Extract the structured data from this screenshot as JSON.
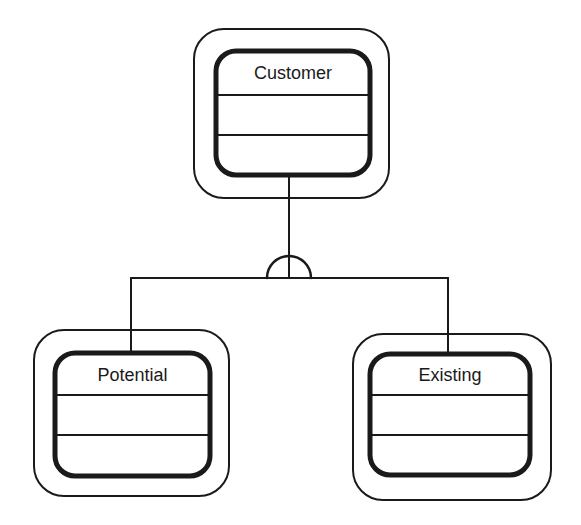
{
  "diagram": {
    "type": "generalization-hierarchy",
    "stroke_color": "#1a1a1a",
    "background": "#ffffff",
    "parent": {
      "name": "Customer",
      "compartments": 3
    },
    "children": [
      {
        "name": "Potential",
        "compartments": 3
      },
      {
        "name": "Existing",
        "compartments": 3
      }
    ],
    "connector": {
      "symbol": "semicircle-generalization"
    }
  }
}
